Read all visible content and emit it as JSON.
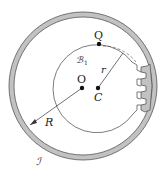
{
  "diagram": {
    "type": "geometry-gear-mechanism",
    "outer_ring": {
      "label": "ℐ",
      "cx": 83,
      "cy": 86,
      "r_outer": 74,
      "r_inner": 69,
      "fill": "#b8b8b8",
      "stroke": "#555555"
    },
    "inner_circle": {
      "label": "B₁",
      "center_label": "C",
      "cx": 98,
      "cy": 88,
      "r": 44
    },
    "points": [
      {
        "name": "O",
        "x": 82,
        "y": 88
      },
      {
        "name": "C",
        "x": 98,
        "y": 88
      },
      {
        "name": "Q",
        "x": 99,
        "y": 44
      }
    ],
    "labels": {
      "Q": "Q",
      "O": "O",
      "C": "C",
      "r": "r",
      "R": "R",
      "B1": "ℬ",
      "B1_sub": "1",
      "I": "ℐ"
    },
    "colors": {
      "ring": "#b8b8b8",
      "line": "#333333",
      "point": "#111111"
    }
  }
}
